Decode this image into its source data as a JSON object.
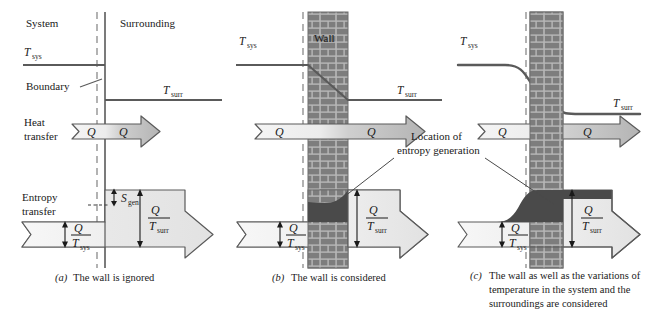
{
  "figure": {
    "type": "thermodynamics-schematic",
    "panel_count": 3
  },
  "colors": {
    "wall_brick": "#7d7d7d",
    "wall_mortar": "#b8b8b8",
    "arrow_fill_light": "#f2f2f2",
    "arrow_fill_dark": "#c9c9c9",
    "entropy_gen_region": "#4a4a4a",
    "line": "#4a4a4a",
    "dashed_boundary": "#8a8a8a",
    "text": "#1a1a1a"
  },
  "panel_a": {
    "label_system": "System",
    "label_surrounding": "Surrounding",
    "label_boundary": "Boundary",
    "label_t_sys": "T",
    "label_t_sys_sub": "sys",
    "label_t_surr": "T",
    "label_t_surr_sub": "surr",
    "label_heat_transfer_line1": "Heat",
    "label_heat_transfer_line2": "transfer",
    "label_entropy_transfer_line1": "Entropy",
    "label_entropy_transfer_line2": "transfer",
    "q_left": "Q",
    "q_right": "Q",
    "ratio_left_num": "Q",
    "ratio_left_den": "T",
    "ratio_left_den_sub": "sys",
    "ratio_right_num": "Q",
    "ratio_right_den": "T",
    "ratio_right_den_sub": "surr",
    "s_gen": "S",
    "s_gen_sub": "gen",
    "caption_tag": "(a)",
    "caption_text": "The wall is ignored"
  },
  "panel_b": {
    "label_wall": "Wall",
    "label_t_sys": "T",
    "label_t_sys_sub": "sys",
    "label_t_surr": "T",
    "label_t_surr_sub": "surr",
    "q_left": "Q",
    "q_right": "Q",
    "ratio_left_num": "Q",
    "ratio_left_den": "T",
    "ratio_left_den_sub": "sys",
    "ratio_right_num": "Q",
    "ratio_right_den": "T",
    "ratio_right_den_sub": "surr",
    "caption_tag": "(b)",
    "caption_text": "The wall is considered"
  },
  "panel_c": {
    "label_wall": "Wall",
    "label_t_sys": "T",
    "label_t_sys_sub": "sys",
    "label_t_surr": "T",
    "label_t_surr_sub": "surr",
    "q_left": "Q",
    "q_right": "Q",
    "ratio_left_num": "Q",
    "ratio_left_den": "T",
    "ratio_left_den_sub": "sys",
    "ratio_right_num": "Q",
    "ratio_right_den": "T",
    "ratio_right_den_sub": "surr",
    "caption_tag": "(c)",
    "caption_line1": "The wall as well as the variations of",
    "caption_line2": "temperature in the system and the",
    "caption_line3": "surroundings are considered"
  },
  "annotation": {
    "location_line1": "Location of",
    "location_line2": "entropy generation"
  }
}
